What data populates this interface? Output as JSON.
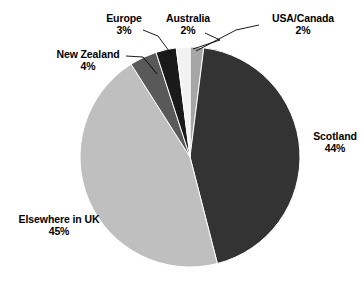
{
  "chart_data": {
    "type": "pie",
    "title": "",
    "subtitle": "",
    "xlabel": "",
    "ylabel": "",
    "grid": false,
    "legend": "none",
    "labels_position": "outside-with-leader-lines",
    "units": "percent",
    "start_angle_deg": 0,
    "direction": "clockwise",
    "categories": [
      "USA/Canada",
      "Scotland",
      "Elsewhere in UK",
      "New Zealand",
      "Europe",
      "Australia"
    ],
    "values": [
      2,
      44,
      45,
      4,
      3,
      2
    ],
    "slices": [
      {
        "name": "USA/Canada",
        "value": 2,
        "value_text": "2%",
        "color": "#a6a6a6"
      },
      {
        "name": "Scotland",
        "value": 44,
        "value_text": "44%",
        "color": "#333333"
      },
      {
        "name": "Elsewhere in UK",
        "value": 45,
        "value_text": "45%",
        "color": "#bfbfbf"
      },
      {
        "name": "New Zealand",
        "value": 4,
        "value_text": "4%",
        "color": "#595959"
      },
      {
        "name": "Europe",
        "value": 3,
        "value_text": "3%",
        "color": "#1a1a1a"
      },
      {
        "name": "Australia",
        "value": 2,
        "value_text": "2%",
        "color": "#f2f2f2"
      }
    ]
  },
  "labels": {
    "europe": {
      "name": "Europe",
      "value": "3%"
    },
    "australia": {
      "name": "Australia",
      "value": "2%"
    },
    "usa_canada": {
      "name": "USA/Canada",
      "value": "2%"
    },
    "new_zealand": {
      "name": "New Zealand",
      "value": "4%"
    },
    "scotland": {
      "name": "Scotland",
      "value": "44%"
    },
    "elsewhere_uk": {
      "name": "Elsewhere in UK",
      "value": "45%"
    }
  },
  "colors": {
    "background": "#ffffff",
    "text": "#000000",
    "leader_line": "#000000",
    "slice_outline": "#ffffff"
  }
}
